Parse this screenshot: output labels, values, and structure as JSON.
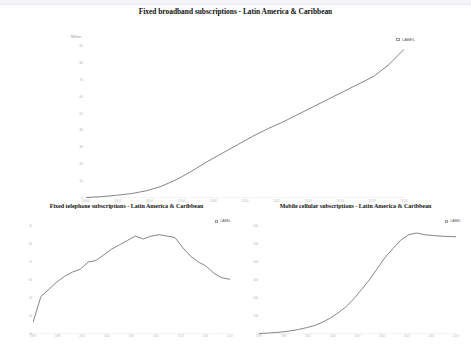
{
  "page": {
    "background": "#ffffff",
    "line_color": "#6f6f77",
    "text_color": "#111111",
    "tick_color": "#b4b4ba"
  },
  "charts": [
    {
      "id": "broadband",
      "title": "Fixed broadband subscriptions - Latin America & Caribbean",
      "ylabel": "Million",
      "legend": {
        "label": "LABEL",
        "icon": "checkbox-icon"
      },
      "chart_data": {
        "type": "line",
        "title": "Fixed broadband subscriptions - Latin America & Caribbean",
        "xlabel": "",
        "ylabel": "Million",
        "grid": false,
        "legend_position": "top-right",
        "series": [
          {
            "name": "LABEL",
            "x": [
              2000,
              2001,
              2002,
              2003,
              2004,
              2005,
              2006,
              2007,
              2008,
              2009,
              2010,
              2011,
              2012,
              2013,
              2014,
              2015,
              2016,
              2017,
              2018,
              2019,
              2020,
              2021
            ],
            "values": [
              0.3,
              0.8,
              1.6,
              2.6,
              4.3,
              7.0,
              11.0,
              16.0,
              21.5,
              26.5,
              31.5,
              36.5,
              41.0,
              45.0,
              49.5,
              54.0,
              58.5,
              63.0,
              67.5,
              72.0,
              79.0,
              88.0
            ]
          }
        ],
        "xticks": [
          "2000",
          "2002",
          "2004",
          "2006",
          "2008",
          "2010",
          "2012",
          "2014",
          "2016",
          "2018",
          "2020"
        ],
        "yticks": [
          "90",
          "80",
          "70",
          "60",
          "50",
          "40",
          "30",
          "20",
          "10",
          "0"
        ],
        "ylim": [
          0,
          90
        ],
        "xlim": [
          2000,
          2021
        ]
      }
    },
    {
      "id": "telephone",
      "title": "Fixed telephone subscriptions - Latin America & Caribbean",
      "ylabel": "Million",
      "legend": {
        "label": "LABEL",
        "icon": "checkbox-icon"
      },
      "chart_data": {
        "type": "line",
        "title": "Fixed telephone subscriptions - Latin America & Caribbean",
        "xlabel": "",
        "ylabel": "Million",
        "grid": false,
        "legend_position": "top-right",
        "series": [
          {
            "name": "LABEL",
            "x": [
              1995,
              1996,
              1997,
              1998,
              1999,
              2000,
              2001,
              2002,
              2003,
              2004,
              2005,
              2006,
              2007,
              2008,
              2009,
              2010,
              2011,
              2012,
              2013,
              2014,
              2015,
              2016,
              2017,
              2018,
              2019,
              2020
            ],
            "values": [
              28,
              46,
              51,
              56,
              60,
              63,
              65,
              70,
              71,
              75,
              79,
              82,
              85,
              88,
              86,
              88,
              89,
              88,
              87,
              80,
              74,
              70,
              67,
              62,
              59,
              58
            ]
          }
        ],
        "xticks": [
          "1995",
          "1998",
          "2001",
          "2004",
          "2007",
          "2010",
          "2013",
          "2016",
          "2019"
        ],
        "yticks": [
          "90",
          "80",
          "70",
          "60",
          "50",
          "40",
          "30"
        ],
        "ylim": [
          20,
          95
        ],
        "xlim": [
          1995,
          2020
        ]
      }
    },
    {
      "id": "mobile",
      "title": "Mobile cellular subscriptions - Latin America & Caribbean",
      "ylabel": "Million",
      "legend": {
        "label": "LABEL",
        "icon": "checkbox-icon"
      },
      "chart_data": {
        "type": "line",
        "title": "Mobile cellular subscriptions - Latin America & Caribbean",
        "xlabel": "",
        "ylabel": "Million",
        "grid": false,
        "legend_position": "top-right",
        "series": [
          {
            "name": "LABEL",
            "x": [
              1995,
              1996,
              1997,
              1998,
              1999,
              2000,
              2001,
              2002,
              2003,
              2004,
              2005,
              2006,
              2007,
              2008,
              2009,
              2010,
              2011,
              2012,
              2013,
              2014,
              2015,
              2016,
              2017,
              2018,
              2019,
              2020
            ],
            "values": [
              3,
              5,
              8,
              12,
              18,
              26,
              36,
              48,
              66,
              90,
              120,
              155,
              200,
              255,
              310,
              375,
              440,
              490,
              540,
              570,
              580,
              570,
              566,
              562,
              560,
              558
            ]
          }
        ],
        "xticks": [
          "1995",
          "1998",
          "2001",
          "2004",
          "2007",
          "2010",
          "2013",
          "2016",
          "2019"
        ],
        "yticks": [
          "600",
          "500",
          "400",
          "300",
          "200",
          "100",
          "0"
        ],
        "ylim": [
          0,
          620
        ],
        "xlim": [
          1995,
          2020
        ]
      }
    }
  ]
}
